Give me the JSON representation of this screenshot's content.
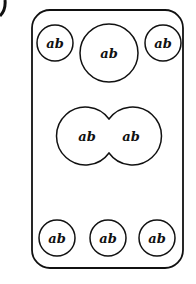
{
  "diagram": {
    "colors": {
      "stroke": "#111111",
      "background": "#ffffff"
    },
    "container": {
      "x": 32,
      "y": 10,
      "width": 151,
      "height": 258,
      "radius": 18
    },
    "corner_mark": {
      "visible": true
    },
    "top_row": [
      {
        "label": "ab",
        "cx": 55,
        "cy": 43,
        "r": 18
      },
      {
        "label": "ab",
        "cx": 109,
        "cy": 53,
        "r": 29
      },
      {
        "label": "ab",
        "cx": 163,
        "cy": 43,
        "r": 18
      }
    ],
    "middle_pair": [
      {
        "label": "ab",
        "cx": 87,
        "cy": 136
      },
      {
        "label": "ab",
        "cx": 131,
        "cy": 136
      }
    ],
    "bottom_row": [
      {
        "label": "ab",
        "cx": 57,
        "cy": 238,
        "r": 18
      },
      {
        "label": "ab",
        "cx": 108,
        "cy": 238,
        "r": 18
      },
      {
        "label": "ab",
        "cx": 157,
        "cy": 238,
        "r": 18
      }
    ]
  }
}
